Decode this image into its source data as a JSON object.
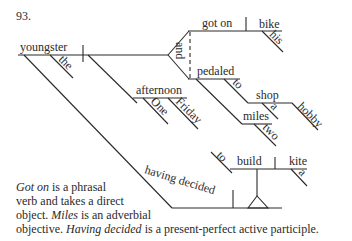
{
  "problem_number": "93.",
  "diagram": {
    "subject": "youngster",
    "subject_modifier": "the",
    "conjunction": "and",
    "verbs": [
      {
        "verb": "got on",
        "object": "bike",
        "object_modifier": "his"
      },
      {
        "verb": "pedaled",
        "preposition": "to",
        "prep_object": "shop",
        "prep_object_modifiers": [
          "a",
          "hobby"
        ],
        "adverbial_objective": "miles",
        "adverbial_modifier": "two"
      }
    ],
    "adverbial_noun": "afternoon",
    "adverbial_noun_modifiers": [
      "One",
      "Friday"
    ],
    "participle": "having decided",
    "infinitive": {
      "marker": "to",
      "verb": "build",
      "object": "kite",
      "object_modifier": "a"
    }
  },
  "caption": {
    "line1_italic": "Got on",
    "line1_rest": " is a phrasal",
    "line2": "verb and takes a direct",
    "line3_pre": "object. ",
    "line3_italic": "Miles",
    "line3_rest": " is an adverbial",
    "line4_pre": "objective. ",
    "line4_italic": "Having decided",
    "line4_rest": " is a present-perfect active participle."
  }
}
